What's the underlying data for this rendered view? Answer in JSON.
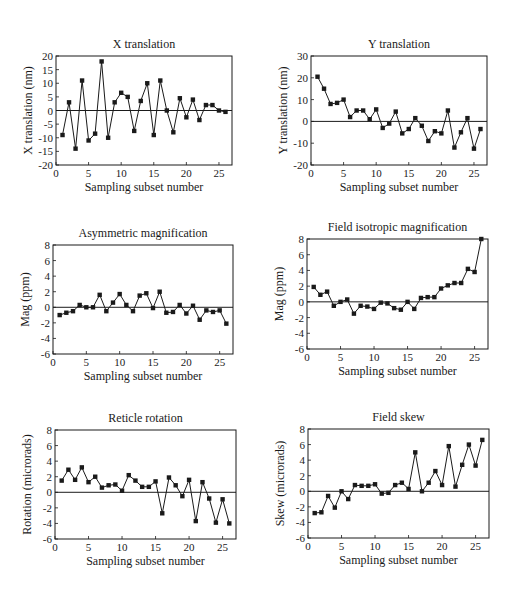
{
  "chart_data": [
    {
      "type": "line",
      "title": "X translation",
      "xlabel": "Sampling subset number",
      "ylabel": "X translation (nm)",
      "xlim": [
        0,
        27
      ],
      "ylim": [
        -20,
        20
      ],
      "xticks": [
        0,
        5,
        10,
        15,
        20,
        25
      ],
      "yticks": [
        -20,
        -15,
        -10,
        -5,
        0,
        5,
        10,
        15,
        20
      ],
      "grid": false,
      "zero_line": true,
      "marker": "square",
      "x": [
        1,
        2,
        3,
        4,
        5,
        6,
        7,
        8,
        9,
        10,
        11,
        12,
        13,
        14,
        15,
        16,
        17,
        18,
        19,
        20,
        21,
        22,
        23,
        24,
        25,
        26
      ],
      "series": [
        {
          "name": "X translation",
          "values": [
            -9,
            3,
            -14,
            11,
            -11,
            -8.5,
            18,
            -10,
            3,
            6.5,
            5,
            -7.5,
            3.5,
            10,
            -9,
            11,
            0,
            -8,
            4.5,
            -2.5,
            4,
            -3.5,
            2,
            2,
            0,
            -0.5
          ]
        }
      ],
      "frame": {
        "left": 56,
        "top": 56,
        "right": 232,
        "bottom": 165
      }
    },
    {
      "type": "line",
      "title": "Y translation",
      "xlabel": "Sampling subset number",
      "ylabel": "Y translation (nm)",
      "xlim": [
        0,
        27
      ],
      "ylim": [
        -20,
        30
      ],
      "xticks": [
        0,
        5,
        10,
        15,
        20,
        25
      ],
      "yticks": [
        -20,
        -10,
        0,
        10,
        20,
        30
      ],
      "grid": false,
      "zero_line": true,
      "marker": "square",
      "x": [
        1,
        2,
        3,
        4,
        5,
        6,
        7,
        8,
        9,
        10,
        11,
        12,
        13,
        14,
        15,
        16,
        17,
        18,
        19,
        20,
        21,
        22,
        23,
        24,
        25,
        26
      ],
      "series": [
        {
          "name": "Y translation",
          "values": [
            20.5,
            15,
            8,
            8.5,
            10,
            2,
            5,
            5,
            1,
            5.5,
            -3,
            -1,
            4.5,
            -5.5,
            -3.5,
            1.5,
            -2,
            -9,
            -4.5,
            -5.5,
            5,
            -12,
            -5,
            1.5,
            -12.5,
            -3.5
          ]
        }
      ],
      "frame": {
        "left": 311,
        "top": 56,
        "right": 487,
        "bottom": 165
      }
    },
    {
      "type": "line",
      "title": "Asymmetric magnification",
      "xlabel": "Sampling subset number",
      "ylabel": "Mag (ppm)",
      "xlim": [
        0,
        27
      ],
      "ylim": [
        -6,
        8
      ],
      "xticks": [
        0,
        5,
        10,
        15,
        20,
        25
      ],
      "yticks": [
        -6,
        -4,
        -2,
        0,
        2,
        4,
        6,
        8
      ],
      "grid": false,
      "zero_line": true,
      "marker": "square",
      "x": [
        1,
        2,
        3,
        4,
        5,
        6,
        7,
        8,
        9,
        10,
        11,
        12,
        13,
        14,
        15,
        16,
        17,
        18,
        19,
        20,
        21,
        22,
        23,
        24,
        25,
        26
      ],
      "series": [
        {
          "name": "Asymmetric magnification",
          "values": [
            -1.0,
            -0.7,
            -0.5,
            0.3,
            0,
            0,
            1.6,
            -0.5,
            0.6,
            1.7,
            0.3,
            -0.5,
            1.5,
            1.8,
            -0.1,
            2.0,
            -0.7,
            -0.6,
            0.3,
            -0.8,
            0.2,
            -1.6,
            -0.4,
            -0.6,
            -0.4,
            -2.1
          ]
        }
      ],
      "frame": {
        "left": 53,
        "top": 245,
        "right": 233,
        "bottom": 354
      }
    },
    {
      "type": "line",
      "title": "Field isotropic magnification",
      "xlabel": "Sampling subset number",
      "ylabel": "Mag (ppm)",
      "xlim": [
        0,
        27
      ],
      "ylim": [
        -6,
        8
      ],
      "xticks": [
        0,
        5,
        10,
        15,
        20,
        25
      ],
      "yticks": [
        -6,
        -4,
        -2,
        0,
        2,
        4,
        6,
        8
      ],
      "grid": false,
      "zero_line": true,
      "marker": "square",
      "x": [
        1,
        2,
        3,
        4,
        5,
        6,
        7,
        8,
        9,
        10,
        11,
        12,
        13,
        14,
        15,
        16,
        17,
        18,
        19,
        20,
        21,
        22,
        23,
        24,
        25,
        26
      ],
      "series": [
        {
          "name": "Field isotropic magnification",
          "values": [
            1.9,
            0.9,
            1.3,
            -0.5,
            0,
            0.3,
            -1.5,
            -0.5,
            -0.6,
            -0.9,
            -0.1,
            -0.2,
            -0.8,
            -1.0,
            0,
            -0.9,
            0.5,
            0.6,
            0.6,
            1.7,
            2.1,
            2.4,
            2.4,
            4.2,
            3.8,
            8.0
          ]
        }
      ],
      "frame": {
        "left": 307,
        "top": 239,
        "right": 488,
        "bottom": 349
      }
    },
    {
      "type": "line",
      "title": "Reticle rotation",
      "xlabel": "Sampling subset number",
      "ylabel": "Rotation (microrads)",
      "xlim": [
        0,
        27
      ],
      "ylim": [
        -6,
        8
      ],
      "xticks": [
        0,
        5,
        10,
        15,
        20,
        25
      ],
      "yticks": [
        -6,
        -4,
        -2,
        0,
        2,
        4,
        6,
        8
      ],
      "grid": false,
      "zero_line": true,
      "marker": "square",
      "x": [
        1,
        2,
        3,
        4,
        5,
        6,
        7,
        8,
        9,
        10,
        11,
        12,
        13,
        14,
        15,
        16,
        17,
        18,
        19,
        20,
        21,
        22,
        23,
        24,
        25,
        26
      ],
      "series": [
        {
          "name": "Reticle rotation",
          "values": [
            1.5,
            2.9,
            1.6,
            3.2,
            1.3,
            2.0,
            0.6,
            0.9,
            1.0,
            0.2,
            2.2,
            1.5,
            0.7,
            0.7,
            1.4,
            -2.7,
            1.9,
            0.9,
            -0.5,
            1.6,
            -3.7,
            1.3,
            -0.8,
            -3.9,
            -0.9,
            -4.0
          ]
        }
      ],
      "frame": {
        "left": 55,
        "top": 430,
        "right": 236,
        "bottom": 539
      }
    },
    {
      "type": "line",
      "title": "Field skew",
      "xlabel": "Sampling subset number",
      "ylabel": "Skew (microrads)",
      "xlim": [
        0,
        27
      ],
      "ylim": [
        -6,
        8
      ],
      "xticks": [
        0,
        5,
        10,
        15,
        20,
        25
      ],
      "yticks": [
        -6,
        -4,
        -2,
        0,
        2,
        4,
        6,
        8
      ],
      "grid": false,
      "zero_line": true,
      "marker": "square",
      "x": [
        1,
        2,
        3,
        4,
        5,
        6,
        7,
        8,
        9,
        10,
        11,
        12,
        13,
        14,
        15,
        16,
        17,
        18,
        19,
        20,
        21,
        22,
        23,
        24,
        25,
        26
      ],
      "series": [
        {
          "name": "Field skew",
          "values": [
            -2.8,
            -2.7,
            -0.6,
            -2.1,
            0,
            -1.0,
            0.8,
            0.7,
            0.7,
            0.9,
            -0.3,
            -0.2,
            0.8,
            1.1,
            0.3,
            5.0,
            0,
            1.1,
            2.6,
            0.8,
            5.8,
            0.6,
            3.4,
            6.0,
            3.3,
            6.6
          ]
        }
      ],
      "frame": {
        "left": 308,
        "top": 429,
        "right": 489,
        "bottom": 538
      }
    }
  ],
  "style": {
    "ink_color": "#1a1a1a",
    "background": "#ffffff"
  }
}
